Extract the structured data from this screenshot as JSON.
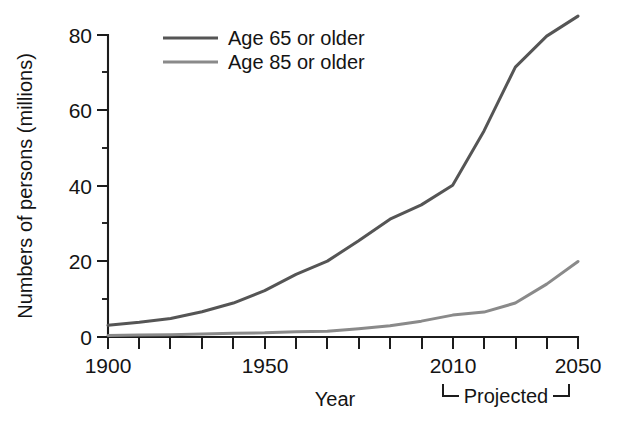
{
  "chart_data": {
    "type": "line",
    "title": "",
    "xlabel": "Year",
    "ylabel": "Numbers of persons (millions)",
    "xlim": [
      1900,
      2050
    ],
    "ylim": [
      0,
      88
    ],
    "grid": false,
    "legend_position": "top-center",
    "x_tick_labels": [
      "1900",
      "1950",
      "2010",
      "2050"
    ],
    "x_tick_values": [
      1900,
      1950,
      2010,
      2050
    ],
    "x_minor_ticks": [
      1910,
      1920,
      1930,
      1940,
      1960,
      1970,
      1980,
      1990,
      2000,
      2020,
      2030,
      2040
    ],
    "y_tick_labels": [
      "0",
      "20",
      "40",
      "60",
      "80"
    ],
    "y_tick_values": [
      0,
      20,
      40,
      60,
      80
    ],
    "y_minor_ticks": [
      10,
      30,
      50,
      70
    ],
    "annotations": [
      {
        "text": "Projected",
        "type": "bracket",
        "x_start": 2010,
        "x_end": 2050
      }
    ],
    "x": [
      1900,
      1910,
      1920,
      1930,
      1940,
      1950,
      1960,
      1970,
      1980,
      1990,
      2000,
      2010,
      2020,
      2030,
      2040,
      2050
    ],
    "series": [
      {
        "name": "Age 65 or older",
        "color": "#555555",
        "values": [
          3.1,
          3.9,
          4.9,
          6.7,
          9.0,
          12.3,
          16.6,
          20.1,
          25.5,
          31.2,
          35.0,
          40.2,
          54.6,
          71.5,
          79.7,
          85.0
        ]
      },
      {
        "name": "Age 85 or older",
        "color": "#8a8a8a",
        "values": [
          0.4,
          0.5,
          0.6,
          0.8,
          1.0,
          1.1,
          1.4,
          1.5,
          2.2,
          3.0,
          4.2,
          5.8,
          6.6,
          9.0,
          14.0,
          20.0
        ]
      }
    ]
  },
  "legend": {
    "entries": [
      {
        "label": "Age 65 or older"
      },
      {
        "label": "Age 85 or older"
      }
    ]
  },
  "axes": {
    "y_title": "Numbers of persons (millions)",
    "x_title": "Year"
  },
  "annotation": {
    "projected_label": "Projected"
  }
}
